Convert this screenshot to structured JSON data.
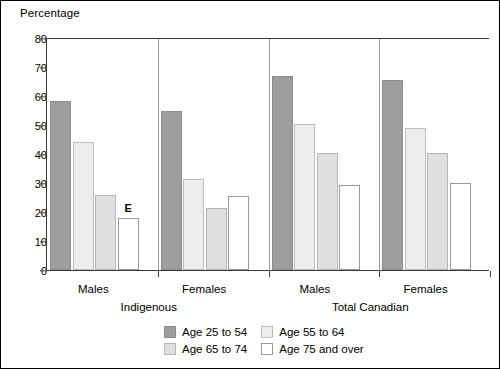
{
  "chart_data": {
    "type": "bar",
    "title": "",
    "ylabel": "Percentage",
    "xlabel": "",
    "ylim": [
      0,
      80
    ],
    "yticks": [
      0,
      10,
      20,
      30,
      40,
      50,
      60,
      70,
      80
    ],
    "grid": false,
    "legend_position": "bottom",
    "categories": [
      "Males",
      "Females",
      "Males",
      "Females"
    ],
    "supergroups": [
      {
        "label": "Indigenous",
        "spans": [
          0,
          1
        ]
      },
      {
        "label": "Total Canadian",
        "spans": [
          2,
          3
        ]
      }
    ],
    "series": [
      {
        "name": "Age 25 to 54",
        "color": "#9e9e9e",
        "values": [
          58.3,
          54.8,
          67.0,
          65.5
        ]
      },
      {
        "name": "Age 55 to 64",
        "color": "#ededed",
        "values": [
          44.0,
          31.5,
          50.5,
          49.0
        ]
      },
      {
        "name": "Age 65 to 74",
        "color": "#e0e0e0",
        "values": [
          26.0,
          21.5,
          40.5,
          40.2
        ]
      },
      {
        "name": "Age 75 and over",
        "color": "#ffffff",
        "values": [
          18.0,
          25.5,
          29.3,
          30.0
        ]
      }
    ],
    "annotations": [
      {
        "text": "E",
        "group": 0,
        "series": 3
      }
    ]
  }
}
